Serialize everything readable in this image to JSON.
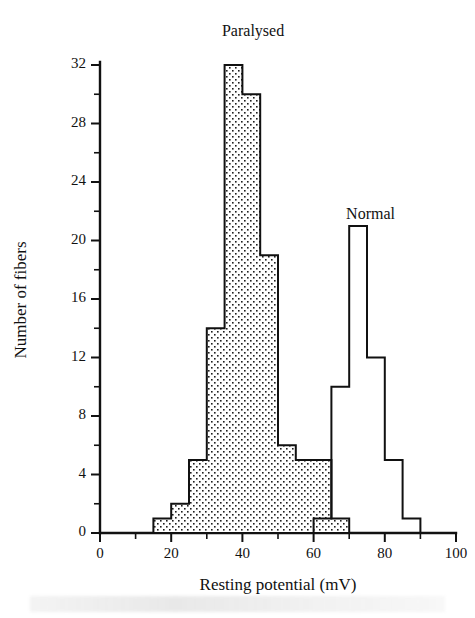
{
  "figure": {
    "title": "",
    "xlabel": "Resting potential (mV)",
    "ylabel": "Number of fibers"
  },
  "labels": {
    "paralysed": "Paralysed",
    "normal": "Normal"
  },
  "axes": {
    "x_ticklabels": [
      "0",
      "20",
      "40",
      "60",
      "80",
      "100"
    ],
    "y_ticklabels": [
      "0",
      "4",
      "8",
      "12",
      "16",
      "20",
      "24",
      "28",
      "32"
    ]
  },
  "chart_data": {
    "type": "bar",
    "title": "",
    "xlabel": "Resting potential (mV)",
    "ylabel": "Number of fibers",
    "xlim": [
      0,
      100
    ],
    "ylim": [
      0,
      32
    ],
    "xtick_major": [
      0,
      20,
      40,
      60,
      80,
      100
    ],
    "xtick_minor": [
      10,
      30,
      50,
      70,
      90
    ],
    "ytick_major": [
      0,
      4,
      8,
      12,
      16,
      20,
      24,
      28,
      32
    ],
    "ytick_minor": [
      2,
      6,
      10,
      14,
      18,
      22,
      26,
      30
    ],
    "grid": false,
    "legend": "inline annotations above each distribution",
    "bin_width": 5,
    "series": [
      {
        "name": "Paralysed",
        "style": "stippled fill with black outline",
        "fill": "#ffffff",
        "stipple": "#1a1a1a",
        "bin_starts": [
          15,
          20,
          25,
          30,
          35,
          40,
          45,
          50,
          55,
          60,
          65
        ],
        "bin_ends": [
          20,
          25,
          30,
          35,
          40,
          45,
          50,
          55,
          60,
          65,
          70
        ],
        "values": [
          1,
          2,
          5,
          14,
          32,
          30,
          19,
          6,
          5,
          5,
          1
        ],
        "label_x": 43,
        "label_y": 34
      },
      {
        "name": "Normal",
        "style": "open outline, no fill",
        "fill": "none",
        "stroke": "#111111",
        "bin_starts": [
          60,
          65,
          70,
          75,
          80,
          85
        ],
        "bin_ends": [
          65,
          70,
          75,
          80,
          85,
          90
        ],
        "values": [
          1,
          10,
          21,
          12,
          5,
          1
        ],
        "label_x": 76,
        "label_y": 21.5
      }
    ]
  }
}
